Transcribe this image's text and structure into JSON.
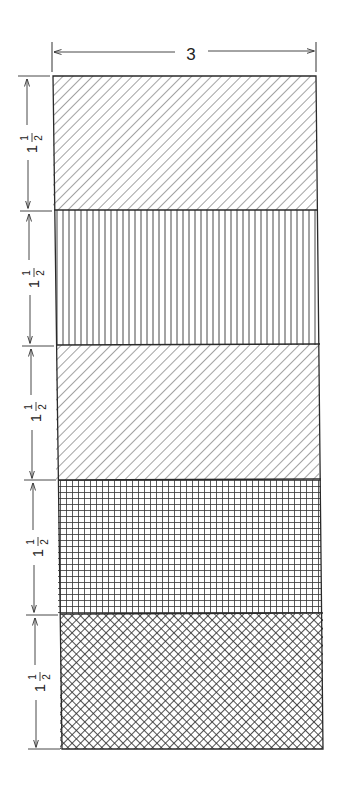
{
  "figure": {
    "width_label": "3",
    "sections": [
      {
        "id": "s1",
        "pattern": "diagonal-hatch-forward",
        "height_label_whole": "1",
        "height_label_num": "1",
        "height_label_den": "2"
      },
      {
        "id": "s2",
        "pattern": "vertical-lines",
        "height_label_whole": "1",
        "height_label_num": "1",
        "height_label_den": "2"
      },
      {
        "id": "s3",
        "pattern": "diagonal-hatch-forward",
        "height_label_whole": "1",
        "height_label_num": "1",
        "height_label_den": "2"
      },
      {
        "id": "s4",
        "pattern": "square-grid",
        "height_label_whole": "1",
        "height_label_num": "1",
        "height_label_den": "2"
      },
      {
        "id": "s5",
        "pattern": "diagonal-crosshatch",
        "height_label_whole": "1",
        "height_label_num": "1",
        "height_label_den": "2"
      }
    ],
    "line_color": "#2a2a2a"
  }
}
